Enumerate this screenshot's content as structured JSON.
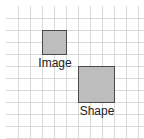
{
  "canvas": {
    "width": 144,
    "height": 139,
    "background": "#ffffff",
    "grid": {
      "spacing": 12,
      "offset_x": 6,
      "offset_y": 6,
      "line_color": "#d9d9d9"
    }
  },
  "objects": [
    {
      "type": "image",
      "label": "Image",
      "x": 42,
      "y": 30,
      "width": 24,
      "height": 24,
      "fill": "#bdbdbd",
      "stroke": "#4a4a4a"
    },
    {
      "type": "shape",
      "label": "Shape",
      "x": 78,
      "y": 66,
      "width": 36,
      "height": 36,
      "fill": "#bdbdbd",
      "stroke": "#4a4a4a"
    }
  ]
}
